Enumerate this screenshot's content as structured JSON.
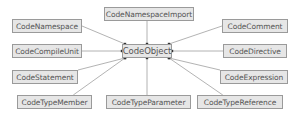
{
  "diagram": {
    "center": {
      "id": "CodeObject",
      "label": "CodeObject",
      "x": 122,
      "y": 44,
      "w": 50,
      "h": 14
    },
    "nodes": [
      {
        "id": "CodeNamespaceImport",
        "label": "CodeNamespaceImport",
        "x": 104,
        "y": 7,
        "w": 90,
        "h": 14
      },
      {
        "id": "CodeNamespace",
        "label": "CodeNamespace",
        "x": 12,
        "y": 19,
        "w": 70,
        "h": 14
      },
      {
        "id": "CodeComment",
        "label": "CodeComment",
        "x": 222,
        "y": 19,
        "w": 66,
        "h": 14
      },
      {
        "id": "CodeCompileUnit",
        "label": "CodeCompileUnit",
        "x": 12,
        "y": 44,
        "w": 70,
        "h": 14
      },
      {
        "id": "CodeDirective",
        "label": "CodeDirective",
        "x": 223,
        "y": 44,
        "w": 64,
        "h": 14
      },
      {
        "id": "CodeStatement",
        "label": "CodeStatement",
        "x": 12,
        "y": 70,
        "w": 66,
        "h": 14
      },
      {
        "id": "CodeExpression",
        "label": "CodeExpression",
        "x": 220,
        "y": 70,
        "w": 68,
        "h": 14
      },
      {
        "id": "CodeTypeMember",
        "label": "CodeTypeMember",
        "x": 17,
        "y": 95,
        "w": 75,
        "h": 14
      },
      {
        "id": "CodeTypeParameter",
        "label": "CodeTypeParameter",
        "x": 106,
        "y": 95,
        "w": 85,
        "h": 14
      },
      {
        "id": "CodeTypeReference",
        "label": "CodeTypeReference",
        "x": 197,
        "y": 95,
        "w": 86,
        "h": 14
      }
    ],
    "edges": [
      {
        "from": "CodeNamespaceImport",
        "to": "CodeObject"
      },
      {
        "from": "CodeNamespace",
        "to": "CodeObject"
      },
      {
        "from": "CodeComment",
        "to": "CodeObject"
      },
      {
        "from": "CodeCompileUnit",
        "to": "CodeObject"
      },
      {
        "from": "CodeDirective",
        "to": "CodeObject"
      },
      {
        "from": "CodeStatement",
        "to": "CodeObject"
      },
      {
        "from": "CodeExpression",
        "to": "CodeObject"
      },
      {
        "from": "CodeTypeMember",
        "to": "CodeObject"
      },
      {
        "from": "CodeTypeParameter",
        "to": "CodeObject"
      },
      {
        "from": "CodeTypeReference",
        "to": "CodeObject"
      }
    ],
    "colors": {
      "box_fill": "#e6e6e6",
      "box_border": "#9a9a9a",
      "line": "#a0a0a0",
      "text": "#555555"
    }
  }
}
